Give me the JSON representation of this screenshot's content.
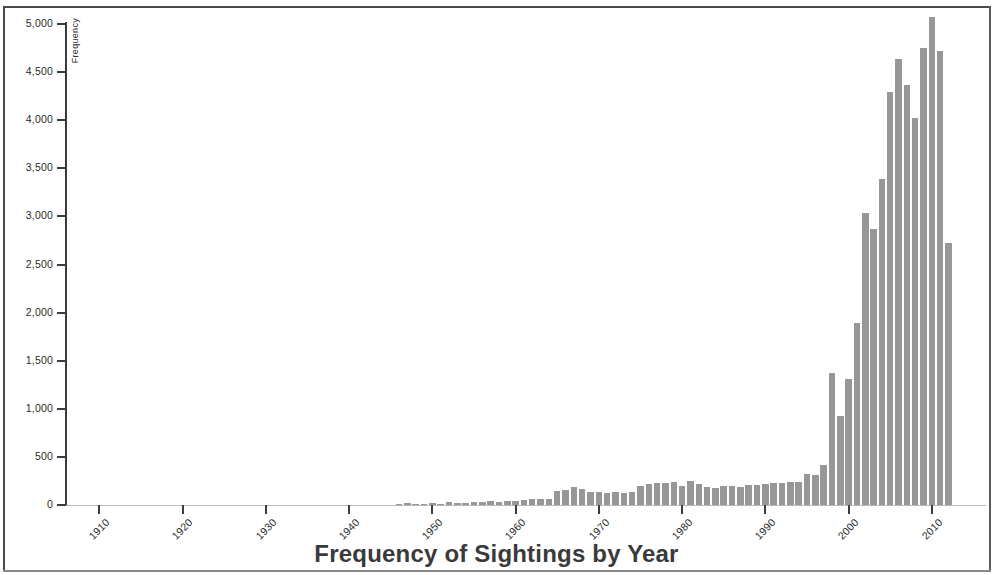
{
  "figure": {
    "title": "Frequency of Sightings by Year",
    "bar_color": "#979797",
    "axis_color": "#3c3c3c",
    "background": "#ffffff"
  },
  "chart_data": {
    "type": "bar",
    "title": "Frequency of Sightings by Year",
    "xlabel": "",
    "ylabel": "Frequency",
    "xlim": [
      1906,
      2016
    ],
    "ylim": [
      0,
      5200
    ],
    "grid": false,
    "legend": null,
    "y_ticks": [
      "0",
      "500",
      "1,000",
      "1,500",
      "2,000",
      "2,500",
      "3,000",
      "3,500",
      "4,000",
      "4,500",
      "5,000"
    ],
    "y_tick_values": [
      0,
      500,
      1000,
      1500,
      2000,
      2500,
      3000,
      3500,
      4000,
      4500,
      5000
    ],
    "x_ticks": [
      "1910",
      "1920",
      "1930",
      "1940",
      "1950",
      "1960",
      "1970",
      "1980",
      "1990",
      "2000",
      "2010"
    ],
    "x_tick_values": [
      1910,
      1920,
      1930,
      1940,
      1950,
      1960,
      1970,
      1980,
      1990,
      2000,
      2010
    ],
    "categories": [
      1910,
      1911,
      1912,
      1913,
      1914,
      1915,
      1916,
      1917,
      1918,
      1919,
      1920,
      1921,
      1922,
      1923,
      1924,
      1925,
      1926,
      1927,
      1928,
      1929,
      1930,
      1931,
      1932,
      1933,
      1934,
      1935,
      1936,
      1937,
      1938,
      1939,
      1940,
      1941,
      1942,
      1943,
      1944,
      1945,
      1946,
      1947,
      1948,
      1949,
      1950,
      1951,
      1952,
      1953,
      1954,
      1955,
      1956,
      1957,
      1958,
      1959,
      1960,
      1961,
      1962,
      1963,
      1964,
      1965,
      1966,
      1967,
      1968,
      1969,
      1970,
      1971,
      1972,
      1973,
      1974,
      1975,
      1976,
      1977,
      1978,
      1979,
      1980,
      1981,
      1982,
      1983,
      1984,
      1985,
      1986,
      1987,
      1988,
      1989,
      1990,
      1991,
      1992,
      1993,
      1994,
      1995,
      1996,
      1997,
      1998,
      1999,
      2000,
      2001,
      2002,
      2003,
      2004,
      2005,
      2006,
      2007,
      2008,
      2009,
      2010,
      2011,
      2012,
      2013,
      2014
    ],
    "values": [
      1,
      1,
      2,
      1,
      2,
      1,
      2,
      1,
      2,
      2,
      2,
      2,
      3,
      2,
      3,
      3,
      3,
      3,
      3,
      4,
      4,
      4,
      4,
      4,
      5,
      5,
      5,
      6,
      6,
      6,
      8,
      9,
      9,
      12,
      12,
      14,
      16,
      30,
      20,
      20,
      28,
      25,
      40,
      30,
      35,
      40,
      45,
      50,
      45,
      50,
      55,
      60,
      70,
      70,
      75,
      160,
      165,
      195,
      180,
      150,
      150,
      140,
      150,
      140,
      145,
      205,
      230,
      235,
      240,
      245,
      210,
      255,
      230,
      200,
      190,
      210,
      210,
      200,
      215,
      220,
      225,
      235,
      240,
      250,
      245,
      330,
      325,
      430,
      1380,
      940,
      1320,
      1900,
      3050,
      2880,
      3400,
      4300,
      4650,
      4380,
      4030,
      4760,
      5080,
      4730,
      2730,
      0,
      0
    ],
    "notes": {
      "peak_year": 2010,
      "peak_value": 5080,
      "bar_width_years": 1
    }
  },
  "axis": {
    "y_title": "Frequency"
  }
}
